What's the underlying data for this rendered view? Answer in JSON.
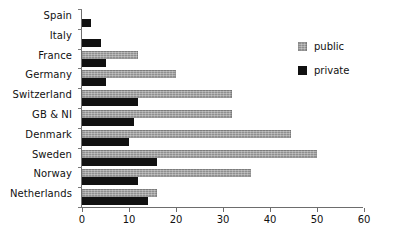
{
  "chart_data": {
    "type": "bar",
    "orientation": "horizontal",
    "title": "",
    "subtitle": "",
    "xlabel": "",
    "ylabel": "",
    "xlim": [
      0,
      60
    ],
    "xticks": [
      0,
      10,
      20,
      30,
      40,
      50,
      60
    ],
    "xtick_labels": [
      "0",
      "10",
      "20",
      "30",
      "40",
      "50",
      "60"
    ],
    "grid": false,
    "legend_position": "right",
    "categories": [
      "Spain",
      "Italy",
      "France",
      "Germany",
      "Switzerland",
      "GB & NI",
      "Denmark",
      "Sweden",
      "Norway",
      "Netherlands"
    ],
    "series": [
      {
        "name": "public",
        "color": "#8f8f8f",
        "values": [
          0,
          0,
          12,
          20,
          32,
          32,
          44.5,
          50,
          36,
          16
        ]
      },
      {
        "name": "private",
        "color": "#111111",
        "values": [
          2,
          4,
          5,
          5,
          12,
          11,
          10,
          16,
          12,
          14
        ]
      }
    ]
  },
  "legend": {
    "items": [
      {
        "label": "public",
        "swatch": "public-swatch"
      },
      {
        "label": "private",
        "swatch": "private-swatch"
      }
    ]
  }
}
